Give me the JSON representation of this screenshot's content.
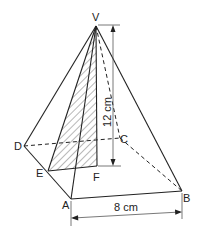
{
  "figure": {
    "type": "square-based pyramid",
    "vertices": {
      "V": "V",
      "A": "A",
      "B": "B",
      "C": "C",
      "D": "D",
      "E": "E",
      "F": "F"
    },
    "dimensions": {
      "height": "12 cm",
      "base_edge": "8 cm"
    },
    "shaded_region": "triangle VEF (hatched)",
    "colors": {
      "stroke": "#222222",
      "background": "#ffffff"
    }
  }
}
